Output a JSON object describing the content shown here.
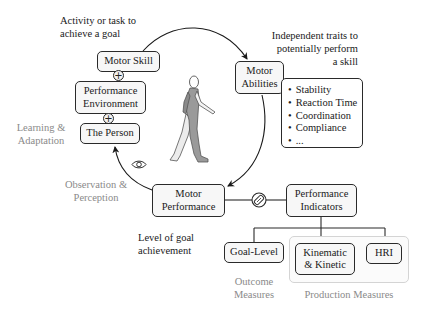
{
  "notes": {
    "activity": "Activity or task to achieve a goal",
    "activity_l1": "Activity or task to",
    "activity_l2": "achieve a goal",
    "traits_l1": "Independent traits to",
    "traits_l2": "potentially perform",
    "traits_l3": "a skill",
    "learning_l1": "Learning &",
    "learning_l2": "Adaptation",
    "observation_l1": "Observation &",
    "observation_l2": "Perception",
    "goal_l1": "Level of goal",
    "goal_l2": "achievement",
    "outcome_l1": "Outcome",
    "outcome_l2": "Measures",
    "production": "Production Measures"
  },
  "boxes": {
    "motor_skill": "Motor Skill",
    "perf_env_l1": "Performance",
    "perf_env_l2": "Environment",
    "the_person": "The Person",
    "motor_abilities_l1": "Motor",
    "motor_abilities_l2": "Abilities",
    "motor_performance_l1": "Motor",
    "motor_performance_l2": "Performance",
    "perf_indicators_l1": "Performance",
    "perf_indicators_l2": "Indicators",
    "goal_level": "Goal-Level",
    "kinematic_l1": "Kinematic",
    "kinematic_l2": "& Kinetic",
    "hri": "HRI"
  },
  "abilities": [
    "Stability",
    "Reaction Time",
    "Coordination",
    "Compliance",
    "..."
  ],
  "symbols": {
    "plus": "+",
    "eye_icon": "eye-icon",
    "sensor_icon": "sensor-icon",
    "figure": "walking-person"
  },
  "colors": {
    "line": "#2a2a2a",
    "box_fill": "#f7f7f7",
    "gray_text": "#8a8a8a",
    "group_border": "#d4d4d4"
  }
}
